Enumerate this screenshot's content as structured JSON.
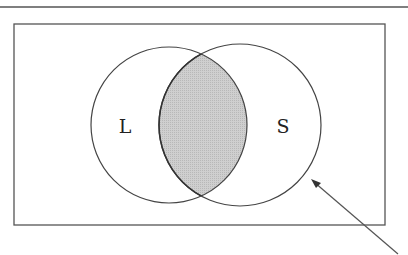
{
  "diagram": {
    "type": "venn",
    "sets": [
      {
        "label": "L",
        "cx": 169,
        "cy": 125,
        "r": 78
      },
      {
        "label": "S",
        "cx": 240,
        "cy": 125,
        "r": 81
      }
    ],
    "highlighted_region": "intersection",
    "colors": {
      "stroke": "#444444",
      "shade": "#c6c6c6",
      "background": "#ffffff"
    }
  }
}
